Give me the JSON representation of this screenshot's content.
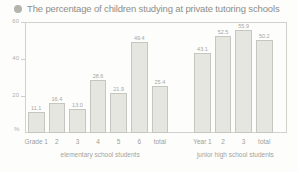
{
  "title": {
    "bullet_icon": "bullet-dot-icon",
    "text": "The percentage of children studying at private tutoring schools"
  },
  "axis": {
    "y_unit": "%",
    "y_ticks": [
      "60",
      "40",
      "20"
    ],
    "y_min": 0,
    "y_max": 60
  },
  "groups": [
    {
      "name": "elementary school students"
    },
    {
      "name": "junior high school students"
    }
  ],
  "bars": [
    {
      "category": "Grade 1",
      "value": 11.1,
      "label": "11.1"
    },
    {
      "category": "2",
      "value": 16.4,
      "label": "16.4"
    },
    {
      "category": "3",
      "value": 13.0,
      "label": "13.0"
    },
    {
      "category": "4",
      "value": 28.6,
      "label": "28.6"
    },
    {
      "category": "5",
      "value": 21.9,
      "label": "21.9"
    },
    {
      "category": "6",
      "value": 49.4,
      "label": "49.4"
    },
    {
      "category": "total",
      "value": 25.4,
      "label": "25.4"
    },
    {
      "category": "Year 1",
      "value": 43.1,
      "label": "43.1"
    },
    {
      "category": "2",
      "value": 52.5,
      "label": "52.5"
    },
    {
      "category": "3",
      "value": 55.9,
      "label": "55.9"
    },
    {
      "category": "total",
      "value": 50.2,
      "label": "50.2"
    }
  ],
  "colors": {
    "bar_fill": "#e6e6e1",
    "bar_stroke": "#c6c6c0",
    "text": "#a9a9a4",
    "frame": "#d2d2cc"
  },
  "chart_data": {
    "type": "bar",
    "title": "The percentage of children studying at private tutoring schools",
    "xlabel": "",
    "ylabel": "%",
    "ylim": [
      0,
      60
    ],
    "yticks": [
      20,
      40,
      60
    ],
    "grid": false,
    "legend": "none",
    "categories": [
      "Grade 1",
      "2",
      "3",
      "4",
      "5",
      "6",
      "total",
      "Year 1",
      "2",
      "3",
      "total"
    ],
    "values": [
      11.1,
      16.4,
      13.0,
      28.6,
      21.9,
      49.4,
      25.4,
      43.1,
      52.5,
      55.9,
      50.2
    ],
    "group_labels": [
      "elementary school students",
      "junior high school students"
    ],
    "group_ranges": [
      [
        0,
        6
      ],
      [
        7,
        10
      ]
    ]
  }
}
